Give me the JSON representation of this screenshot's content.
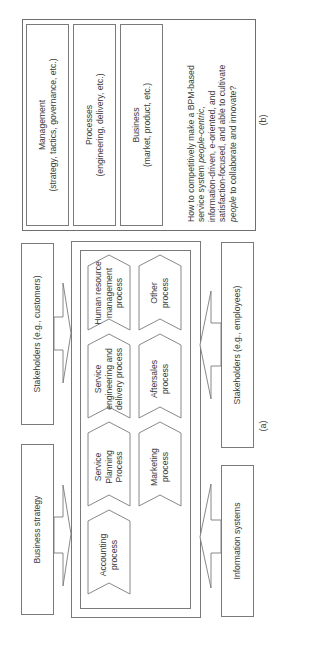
{
  "panel_b": {
    "label": "(b)",
    "boxes": [
      {
        "title": "Management",
        "subtitle": "(strategy, tactics, governance, etc.)"
      },
      {
        "title": "Processes",
        "subtitle": "(engineering, delivery, etc.)"
      },
      {
        "title": "Business",
        "subtitle": "(market, product, etc.)"
      }
    ],
    "question": {
      "part1": "How to competitively make a BPM-based service system ",
      "em1": "people-centric",
      "part2": ", information-driven, e-oriented, and satisfaction-focused, and able to cultivate ",
      "em2": "people",
      "part3": " to collaborate and innovate?"
    }
  },
  "panel_a": {
    "label": "(a)",
    "inputs_left": [
      {
        "label": "Business strategy"
      },
      {
        "label": "Stakeholders (e.g., customers)"
      }
    ],
    "inputs_right": [
      {
        "label": "Information systems"
      },
      {
        "label": "Stakeholders (e.g., employees)"
      }
    ],
    "processes_row1": [
      {
        "label": "Accounting process"
      },
      {
        "label": "Service Planning Process"
      },
      {
        "label": "Service engineering and delivery process"
      },
      {
        "label": "Human resource management process"
      }
    ],
    "processes_row2": [
      {
        "label": "Marketing process"
      },
      {
        "label": "Aftersales process"
      },
      {
        "label": "Other process"
      }
    ]
  },
  "colors": {
    "line": "#7a7a7a",
    "text": "#3a3a3a",
    "background": "#ffffff"
  }
}
